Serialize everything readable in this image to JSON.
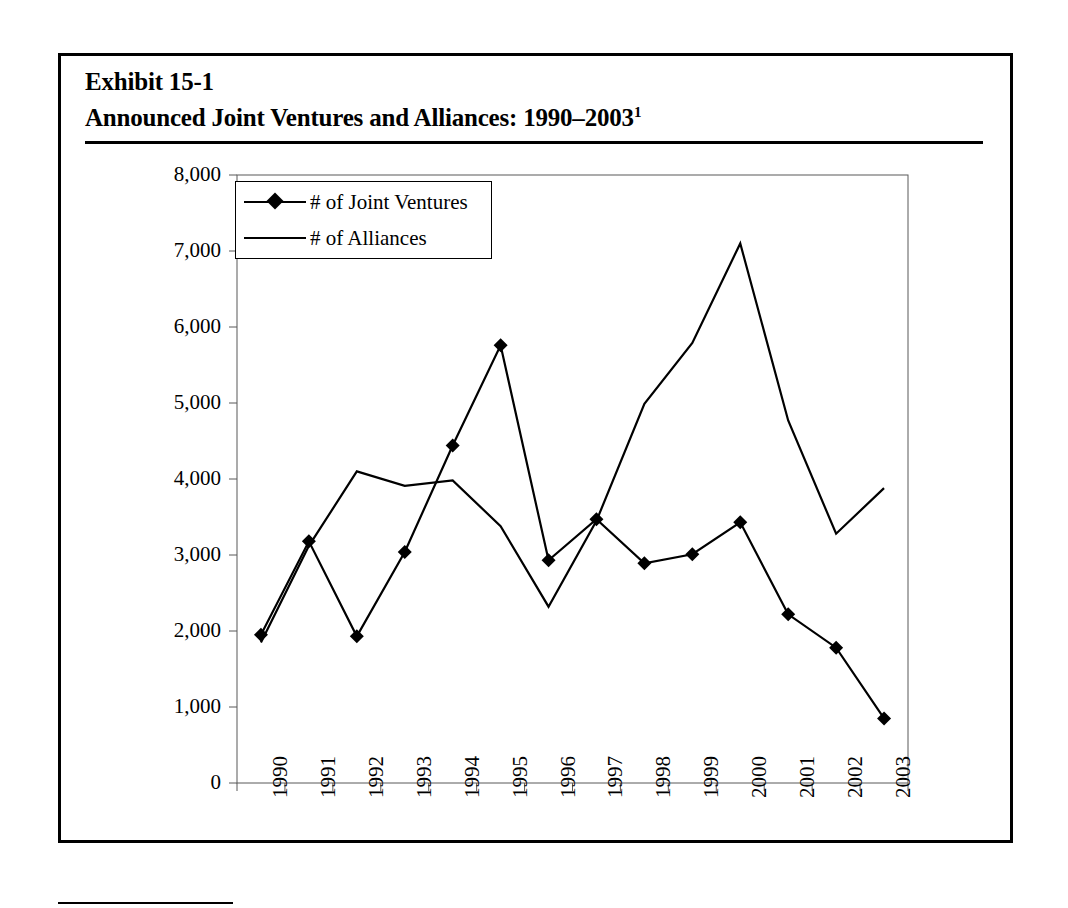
{
  "exhibit": {
    "title_line1": "Exhibit 15-1",
    "title_line2": "Announced Joint Ventures and Alliances: 1990–2003",
    "title_footnote_marker": "1"
  },
  "legend": {
    "items": [
      {
        "label": "# of Joint Ventures",
        "marker": "diamond",
        "color": "#000000"
      },
      {
        "label": "# of Alliances",
        "marker": "none",
        "color": "#000000"
      }
    ]
  },
  "axes": {
    "y_ticks": [
      "8,000",
      "7,000",
      "6,000",
      "5,000",
      "4,000",
      "3,000",
      "2,000",
      "1,000",
      "0"
    ],
    "x_ticks": [
      "1990",
      "1991",
      "1992",
      "1993",
      "1994",
      "1995",
      "1996",
      "1997",
      "1998",
      "1999",
      "2000",
      "2001",
      "2002",
      "2003"
    ]
  },
  "chart_data": {
    "type": "line",
    "title": "Announced Joint Ventures and Alliances: 1990–2003",
    "xlabel": "",
    "ylabel": "",
    "ylim": [
      0,
      8000
    ],
    "ytick_step": 1000,
    "grid": false,
    "legend_position": "top-left-inside",
    "categories": [
      "1990",
      "1991",
      "1992",
      "1993",
      "1994",
      "1995",
      "1996",
      "1997",
      "1998",
      "1999",
      "2000",
      "2001",
      "2002",
      "2003"
    ],
    "series": [
      {
        "name": "# of Joint Ventures",
        "marker": "diamond",
        "color": "#000000",
        "values": [
          1950,
          3180,
          1930,
          3040,
          4440,
          5760,
          2930,
          3470,
          2890,
          3010,
          3430,
          2220,
          1780,
          850
        ]
      },
      {
        "name": "# of Alliances",
        "marker": "none",
        "color": "#000000",
        "values": [
          1850,
          3120,
          4100,
          3910,
          3980,
          3380,
          2320,
          3450,
          4990,
          5790,
          7100,
          4770,
          3280,
          3880
        ]
      }
    ]
  }
}
